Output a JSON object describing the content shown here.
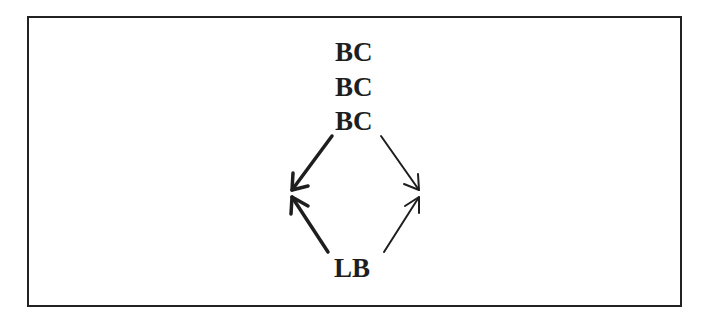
{
  "diagram": {
    "top_nodes": [
      "BC",
      "BC",
      "BC"
    ],
    "bottom_node": "LB",
    "edges": [
      {
        "from": "BC",
        "to": "left-junction",
        "style": "bold"
      },
      {
        "from": "BC",
        "to": "right-junction",
        "style": "thin"
      },
      {
        "from": "LB",
        "to": "left-junction",
        "style": "bold"
      },
      {
        "from": "LB",
        "to": "right-junction",
        "style": "thin"
      }
    ],
    "colors": {
      "ink": "#1e1e1e",
      "border": "#222222",
      "background": "#ffffff"
    }
  }
}
